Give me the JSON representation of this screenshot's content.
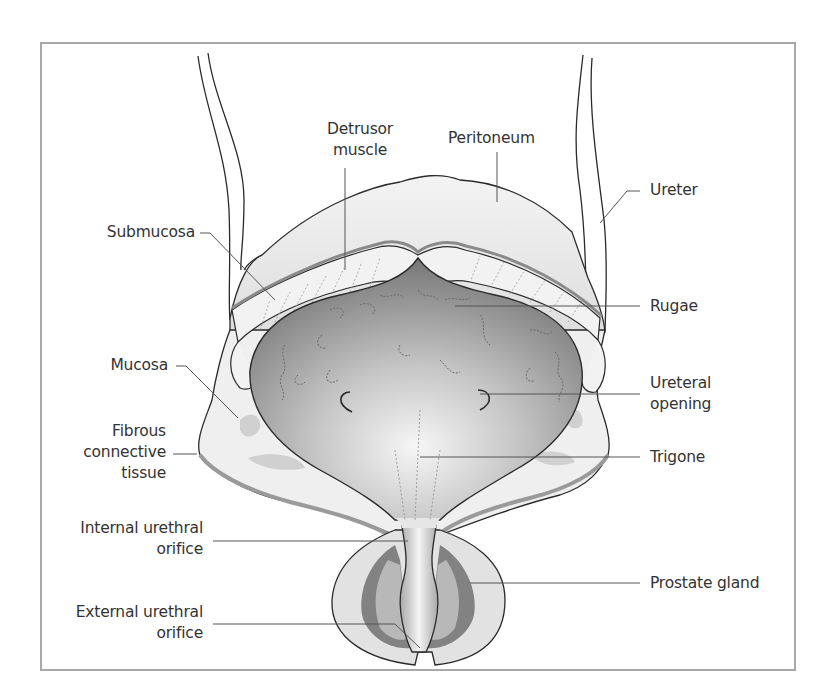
{
  "figure": {
    "colors": {
      "frame": "#a8a8a8",
      "outline": "#2a2a2a",
      "leader_line": "#555555",
      "tissue_light": "#e8e8e8",
      "tissue_mid": "#c9c9c9",
      "lumen_dark": "#8a8a8a",
      "prostate_dark": "#7d7d7d",
      "label_text": "#333333"
    },
    "labels": {
      "detrusor": {
        "line1": "Detrusor",
        "line2": "muscle"
      },
      "peritoneum": {
        "line1": "Peritoneum"
      },
      "ureter": {
        "line1": "Ureter"
      },
      "submucosa": {
        "line1": "Submucosa"
      },
      "rugae": {
        "line1": "Rugae"
      },
      "mucosa": {
        "line1": "Mucosa"
      },
      "ureteral_opening": {
        "line1": "Ureteral",
        "line2": "opening"
      },
      "fibrous": {
        "line1": "Fibrous",
        "line2": "connective",
        "line3": "tissue"
      },
      "trigone": {
        "line1": "Trigone"
      },
      "internal_orifice": {
        "line1": "Internal urethral",
        "line2": "orifice"
      },
      "prostate": {
        "line1": "Prostate gland"
      },
      "external_orifice": {
        "line1": "External urethral",
        "line2": "orifice"
      }
    }
  }
}
